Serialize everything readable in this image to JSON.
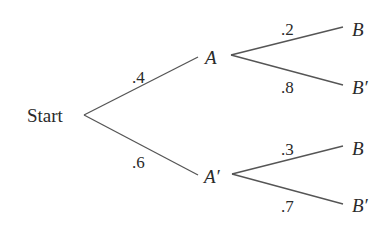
{
  "diagram": {
    "type": "probability-tree",
    "root": {
      "label": "Start"
    },
    "level1": [
      {
        "id": "A",
        "label": "A",
        "prime": false,
        "probability": ".4"
      },
      {
        "id": "A_prime",
        "label": "A′",
        "prime": true,
        "probability": ".6"
      }
    ],
    "level2": [
      {
        "parent": "A",
        "label": "B",
        "probability": ".2"
      },
      {
        "parent": "A",
        "label": "B′",
        "probability": ".8"
      },
      {
        "parent": "A_prime",
        "label": "B",
        "probability": ".3"
      },
      {
        "parent": "A_prime",
        "label": "B′",
        "probability": ".7"
      }
    ]
  },
  "colors": {
    "line": "#555555",
    "text": "#2a2a2a",
    "background": "#ffffff"
  }
}
